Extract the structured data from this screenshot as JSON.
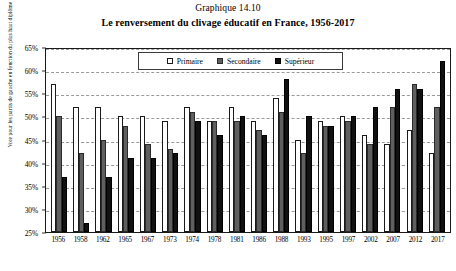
{
  "figure": {
    "number": "Graphique 14.10",
    "title": "Le renversement du clivage éducatif en France, 1956-2017"
  },
  "legend": {
    "items": [
      {
        "label": "Primaire",
        "swatch": "primaire",
        "color": "#ffffff"
      },
      {
        "label": "Secondaire",
        "swatch": "secondaire",
        "color": "#5f5f5f"
      },
      {
        "label": "Supérieur",
        "swatch": "superieur",
        "color": "#111111"
      }
    ]
  },
  "chart_data": {
    "type": "bar",
    "title": "Le renversement du clivage éducatif en France, 1956-2017",
    "subtitle": "Graphique 14.10",
    "xlabel": "",
    "ylabel": "Vote pour les partis de gauche en fonction du plus haut diplôme obtenu",
    "ylim": [
      25,
      65
    ],
    "ytick_labels": [
      "25%",
      "30%",
      "35%",
      "40%",
      "45%",
      "50%",
      "55%",
      "60%",
      "65%"
    ],
    "ytick_values": [
      25,
      30,
      35,
      40,
      45,
      50,
      55,
      60,
      65
    ],
    "grid": true,
    "legend_position": "top-center",
    "categories": [
      "1956",
      "1958",
      "1962",
      "1965",
      "1967",
      "1973",
      "1974",
      "1978",
      "1981",
      "1986",
      "1988",
      "1993",
      "1995",
      "1997",
      "2002",
      "2007",
      "2012",
      "2017"
    ],
    "series": [
      {
        "name": "Primaire",
        "color": "#ffffff",
        "values": [
          57,
          52,
          52,
          50,
          50,
          49,
          52,
          49,
          52,
          49,
          54,
          45,
          49,
          50,
          46,
          44,
          47,
          42
        ]
      },
      {
        "name": "Secondaire",
        "color": "#5f5f5f",
        "values": [
          50,
          42,
          45,
          48,
          44,
          43,
          51,
          49,
          49,
          47,
          51,
          42,
          48,
          49,
          44,
          52,
          57,
          52
        ]
      },
      {
        "name": "Supérieur",
        "color": "#111111",
        "values": [
          37,
          27,
          37,
          41,
          41,
          42,
          49,
          46,
          50,
          46,
          58,
          50,
          48,
          50,
          52,
          56,
          56,
          62
        ]
      }
    ]
  }
}
